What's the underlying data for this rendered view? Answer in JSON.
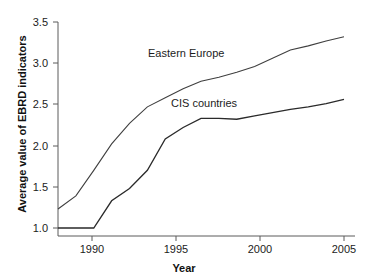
{
  "chart_data": {
    "type": "line",
    "title": "",
    "xlabel": "Year",
    "ylabel": "Average value of EBRD indicators",
    "xlim": [
      1989,
      2005
    ],
    "ylim": [
      1.0,
      3.5
    ],
    "grid": false,
    "legend_position": "inline-annotation",
    "x": [
      1989,
      1990,
      1991,
      1992,
      1993,
      1994,
      1995,
      1996,
      1997,
      1998,
      1999,
      2000,
      2001,
      2002,
      2003,
      2004,
      2005
    ],
    "xticks": [
      1990,
      1995,
      2000,
      2005
    ],
    "xtick_labels": [
      "1990",
      "1995",
      "2000",
      "2005"
    ],
    "yticks": [
      1.0,
      1.5,
      2.0,
      2.5,
      3.0,
      3.5
    ],
    "ytick_labels": [
      "1.0",
      "1.5",
      "2.0",
      "2.5",
      "3.0",
      "3.5"
    ],
    "series": [
      {
        "name": "Eastern Europe",
        "color": "#3f3f3f",
        "values": [
          1.23,
          1.39,
          1.7,
          2.02,
          2.27,
          2.47,
          2.58,
          2.69,
          2.78,
          2.83,
          2.89,
          2.96,
          3.06,
          3.16,
          3.21,
          3.27,
          3.32
        ]
      },
      {
        "name": "CIS countries",
        "color": "#2a2a2a",
        "values": [
          1.0,
          1.0,
          1.0,
          1.33,
          1.48,
          1.7,
          2.08,
          2.22,
          2.33,
          2.33,
          2.32,
          2.36,
          2.4,
          2.44,
          2.47,
          2.51,
          2.56
        ]
      }
    ],
    "annotations": [
      {
        "text": "Eastern Europe",
        "series": "Eastern Europe"
      },
      {
        "text": "CIS countries",
        "series": "CIS countries"
      }
    ]
  },
  "axes": {
    "x_title": "Year",
    "y_title": "Average value of EBRD indicators"
  },
  "labels": {
    "y": {
      "t0": "1.0",
      "t1": "1.5",
      "t2": "2.0",
      "t3": "2.5",
      "t4": "3.0",
      "t5": "3.5"
    },
    "x": {
      "t0": "1990",
      "t1": "1995",
      "t2": "2000",
      "t3": "2005"
    },
    "series": {
      "eastern_europe": "Eastern Europe",
      "cis_countries": "CIS countries"
    }
  }
}
